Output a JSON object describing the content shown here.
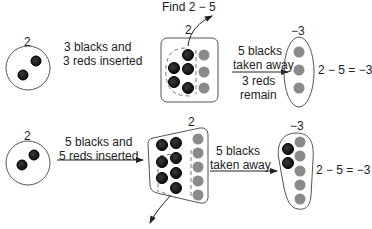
{
  "title": "Find 2 − 5",
  "colors": {
    "black_counter": "#151515",
    "red_counter": "#8a8a8a",
    "outline": "#555555",
    "arrow": "#222222"
  },
  "row1": {
    "start_label": "2",
    "start_counters": {
      "black": 2,
      "red": 0
    },
    "step1_line1": "3 blacks and",
    "step1_line2": "3 reds inserted",
    "middle_label": "2",
    "middle_counters": {
      "black": 5,
      "red": 3
    },
    "step2_line1": "5 blacks",
    "step2_line2": "taken away",
    "step2_line3": "3 reds",
    "step2_line4": "remain",
    "result_label": "−3",
    "result_counters": {
      "black": 0,
      "red": 3
    },
    "equation": "2 − 5 = −3"
  },
  "row2": {
    "start_label": "2",
    "start_counters": {
      "black": 2,
      "red": 0
    },
    "step1_line1": "5 blacks and",
    "step1_line2": "5 reds inserted",
    "middle_label": "2",
    "middle_counters": {
      "black": 7,
      "red": 5
    },
    "step2_line1": "5 blacks",
    "step2_line2": "taken away",
    "result_label": "−3",
    "result_counters": {
      "black": 2,
      "red": 5
    },
    "equation": "2 − 5 = −3"
  }
}
